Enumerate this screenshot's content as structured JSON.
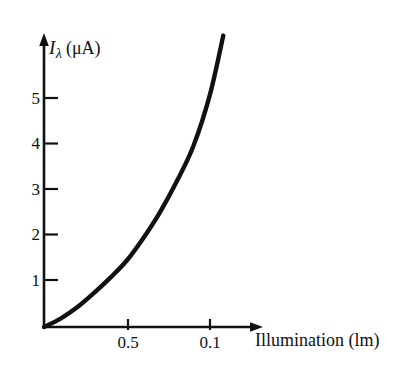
{
  "chart_data": {
    "type": "line",
    "title": "",
    "subtitle": "",
    "xlabel": "Illumination (lm)",
    "ylabel": "Iλ (μA)",
    "ylabel_parts": {
      "symbol": "I",
      "subscript": "λ",
      "unit": "(μA)"
    },
    "xlim": [
      0,
      1.5
    ],
    "ylim": [
      0,
      6.5
    ],
    "grid": false,
    "legend": false,
    "legend_position": "none",
    "x_tick_labels": [
      "0.5",
      "0.1"
    ],
    "x_tick_values": [
      0.5,
      1.0
    ],
    "y_tick_labels": [
      "1",
      "2",
      "3",
      "4",
      "5"
    ],
    "y_tick_values": [
      1,
      2,
      3,
      4,
      5
    ],
    "axis_style": "arrow-ended",
    "series": [
      {
        "name": "photocurrent",
        "color": "#111111",
        "x": [
          0.0,
          0.1,
          0.2,
          0.3,
          0.4,
          0.5,
          0.6,
          0.7,
          0.8,
          0.9,
          1.0,
          1.08
        ],
        "values": [
          0.0,
          0.18,
          0.42,
          0.72,
          1.05,
          1.42,
          1.9,
          2.45,
          3.1,
          3.85,
          4.95,
          6.2
        ]
      }
    ],
    "annotations": []
  },
  "axis_titles": {
    "x": "Illumination (lm)"
  },
  "colors": {
    "ink": "#111111",
    "background": "#ffffff"
  }
}
